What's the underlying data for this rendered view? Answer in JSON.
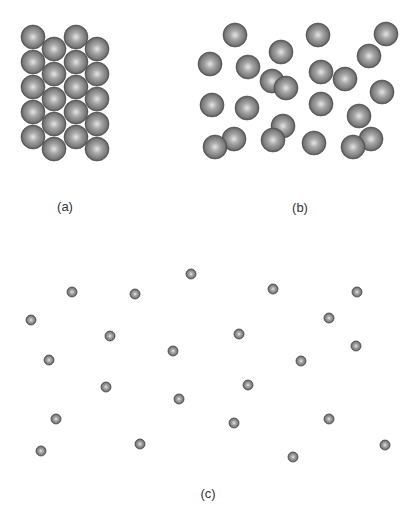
{
  "colors": {
    "background": "#ffffff",
    "sphere_highlight": "#e6e6e6",
    "sphere_mid": "#8a8a8a",
    "sphere_dark": "#3e3e3e",
    "label_text": "#333333"
  },
  "panels": [
    {
      "id": "a",
      "label": "(a)",
      "label_pos": [
        65,
        206
      ],
      "description": "closely packed large spheres",
      "sphere_diameter": 24,
      "spheres": [
        [
          33,
          37
        ],
        [
          33,
          62
        ],
        [
          33,
          87
        ],
        [
          33,
          112
        ],
        [
          33,
          137
        ],
        [
          54,
          49
        ],
        [
          54,
          74
        ],
        [
          54,
          99
        ],
        [
          54,
          124
        ],
        [
          54,
          149
        ],
        [
          76,
          37
        ],
        [
          76,
          62
        ],
        [
          76,
          87
        ],
        [
          76,
          112
        ],
        [
          76,
          137
        ],
        [
          97,
          49
        ],
        [
          97,
          74
        ],
        [
          97,
          99
        ],
        [
          97,
          124
        ],
        [
          97,
          149
        ]
      ]
    },
    {
      "id": "b",
      "label": "(b)",
      "label_pos": [
        300,
        207
      ],
      "description": "randomly arranged large spheres",
      "sphere_diameter": 24,
      "spheres": [
        [
          235,
          35
        ],
        [
          210,
          64
        ],
        [
          248,
          67
        ],
        [
          281,
          52
        ],
        [
          272,
          81
        ],
        [
          286,
          88
        ],
        [
          212,
          105
        ],
        [
          247,
          108
        ],
        [
          318,
          35
        ],
        [
          386,
          34
        ],
        [
          369,
          56
        ],
        [
          321,
          72
        ],
        [
          345,
          79
        ],
        [
          382,
          92
        ],
        [
          321,
          104
        ],
        [
          359,
          116
        ],
        [
          283,
          126
        ],
        [
          273,
          140
        ],
        [
          234,
          139
        ],
        [
          215,
          147
        ],
        [
          314,
          143
        ],
        [
          371,
          139
        ],
        [
          353,
          147
        ]
      ]
    },
    {
      "id": "c",
      "label": "(c)",
      "label_pos": [
        208,
        493
      ],
      "description": "widely spaced small spheres",
      "sphere_diameter": 10,
      "spheres": [
        [
          191,
          274
        ],
        [
          72,
          292
        ],
        [
          135,
          294
        ],
        [
          273,
          289
        ],
        [
          357,
          292
        ],
        [
          31,
          320
        ],
        [
          329,
          318
        ],
        [
          110,
          336
        ],
        [
          239,
          334
        ],
        [
          356,
          346
        ],
        [
          173,
          351
        ],
        [
          49,
          360
        ],
        [
          301,
          361
        ],
        [
          106,
          387
        ],
        [
          248,
          385
        ],
        [
          179,
          399
        ],
        [
          56,
          419
        ],
        [
          234,
          423
        ],
        [
          329,
          419
        ],
        [
          41,
          451
        ],
        [
          140,
          444
        ],
        [
          293,
          457
        ],
        [
          385,
          445
        ]
      ]
    }
  ]
}
